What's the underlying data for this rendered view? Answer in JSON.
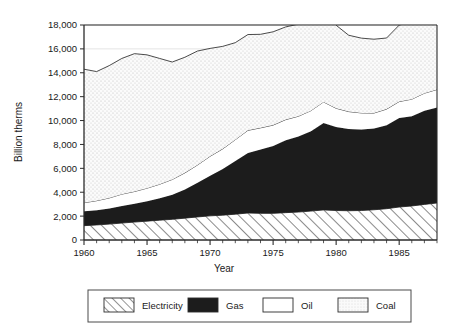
{
  "chart_data": {
    "type": "area",
    "stacked": true,
    "title": "",
    "xlabel": "Year",
    "ylabel": "Billion therms",
    "xlim": [
      1960,
      1988
    ],
    "ylim": [
      0,
      18000
    ],
    "ytick_step": 2000,
    "xtick_step": 5,
    "grid": "horizontal-light",
    "legend_position": "bottom",
    "ytick_labels": [
      "0",
      "2,000",
      "4,000",
      "6,000",
      "8,000",
      "10,000",
      "12,000",
      "14,000",
      "16,000",
      "18,000"
    ],
    "ytick_values": [
      0,
      2000,
      4000,
      6000,
      8000,
      10000,
      12000,
      14000,
      16000,
      18000
    ],
    "xtick_labels": [
      "1960",
      "1965",
      "1970",
      "1975",
      "1980",
      "1985"
    ],
    "xtick_values": [
      1960,
      1965,
      1970,
      1975,
      1980,
      1985
    ],
    "x": [
      1960,
      1961,
      1962,
      1963,
      1964,
      1965,
      1966,
      1967,
      1968,
      1969,
      1970,
      1971,
      1972,
      1973,
      1974,
      1975,
      1976,
      1977,
      1978,
      1979,
      1980,
      1981,
      1982,
      1983,
      1984,
      1985,
      1986,
      1987,
      1988
    ],
    "series": [
      {
        "name": "Electricity",
        "fill": "diagonal-hatch",
        "stack_order": 1,
        "values": [
          1200,
          1260,
          1330,
          1420,
          1500,
          1580,
          1660,
          1730,
          1830,
          1930,
          2020,
          2080,
          2160,
          2260,
          2230,
          2230,
          2290,
          2340,
          2420,
          2520,
          2470,
          2450,
          2470,
          2530,
          2620,
          2760,
          2850,
          2980,
          3100
        ]
      },
      {
        "name": "Gas",
        "fill": "solid-black",
        "stack_order": 2,
        "values": [
          1200,
          1230,
          1310,
          1420,
          1540,
          1660,
          1830,
          2050,
          2400,
          2860,
          3350,
          3860,
          4460,
          5020,
          5340,
          5650,
          6070,
          6320,
          6690,
          7280,
          7000,
          6850,
          6790,
          6800,
          6990,
          7460,
          7520,
          7840,
          8000
        ]
      },
      {
        "name": "Oil",
        "fill": "white",
        "stack_order": 3,
        "values": [
          720,
          800,
          880,
          1000,
          1020,
          1100,
          1180,
          1290,
          1390,
          1490,
          1640,
          1690,
          1780,
          1900,
          1820,
          1740,
          1720,
          1700,
          1720,
          1760,
          1560,
          1450,
          1380,
          1300,
          1350,
          1370,
          1420,
          1470,
          1500
        ]
      },
      {
        "name": "Coal",
        "fill": "light-dotted",
        "stack_order": 4,
        "values": [
          11180,
          10810,
          11080,
          11360,
          11540,
          11160,
          10530,
          9830,
          9680,
          9540,
          9030,
          8580,
          8120,
          8020,
          7830,
          7810,
          7760,
          7710,
          7620,
          7940,
          6950,
          6390,
          6260,
          6180,
          5950,
          6400,
          6500,
          6210,
          5600
        ]
      }
    ],
    "totals": [
      14300,
      14100,
      14600,
      14800,
      15200,
      14500,
      14200,
      14300,
      14900,
      15350,
      15540,
      15640,
      16020,
      16700,
      16800,
      16470,
      16420,
      16420,
      16800,
      17500,
      16280,
      15400,
      15180,
      14980,
      15150,
      16320,
      16490,
      16540,
      16580
    ]
  },
  "legend": {
    "items": [
      {
        "label": "Electricity",
        "swatch": "diagonal-hatch"
      },
      {
        "label": "Gas",
        "swatch": "solid-black"
      },
      {
        "label": "Oil",
        "swatch": "white"
      },
      {
        "label": "Coal",
        "swatch": "light-dotted"
      }
    ]
  }
}
